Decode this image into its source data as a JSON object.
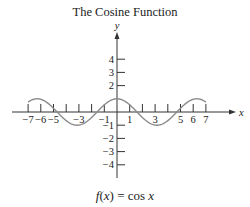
{
  "chart_data": {
    "type": "line",
    "title": "The Cosine Function",
    "caption": "f(x) = cos x",
    "xlabel": "x",
    "ylabel": "y",
    "xlim": [
      -7,
      7
    ],
    "ylim": [
      -4,
      4
    ],
    "grid": false,
    "legend": null,
    "x_ticks": [
      -7,
      -6,
      -5,
      -4,
      -3,
      -2,
      -1,
      1,
      2,
      3,
      4,
      5,
      6,
      7
    ],
    "x_tick_labels": [
      "-7",
      "-6",
      "-5",
      "-3",
      "-1",
      "1",
      "3",
      "5",
      "6",
      "7"
    ],
    "y_ticks": [
      -4,
      -3,
      -2,
      -1,
      1,
      2,
      3,
      4
    ],
    "y_tick_labels": [
      "4",
      "3",
      "2",
      "-1",
      "-2",
      "-3",
      "-4"
    ],
    "series": [
      {
        "name": "cos x",
        "function": "cos(x)",
        "x": [
          -7,
          -6,
          -5,
          -4,
          -3,
          -2,
          -1,
          0,
          1,
          2,
          3,
          4,
          5,
          6,
          7
        ],
        "values": [
          0.754,
          0.96,
          0.284,
          -0.654,
          -0.99,
          -0.416,
          0.54,
          1.0,
          0.54,
          -0.416,
          -0.99,
          -0.654,
          0.284,
          0.96,
          0.754
        ]
      }
    ]
  },
  "labels": {
    "title": "The Cosine Function",
    "caption_f": "f",
    "caption_x": "(x)",
    "caption_eq": " = cos ",
    "caption_var": "x",
    "x_axis": "x",
    "y_axis": "y"
  },
  "style": {
    "curve_color": "#8a8a8a",
    "axis_color": "#333333"
  }
}
